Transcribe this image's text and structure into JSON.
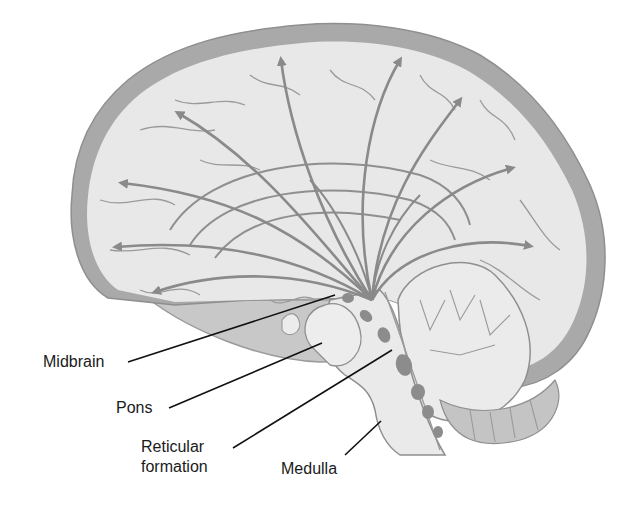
{
  "diagram": {
    "colors": {
      "cortex_fill": "#e8e8e8",
      "cortex_rim": "#a9a9a9",
      "outline": "#8f8f8f",
      "arrow": "#8a8a8a",
      "nucleus": "#8c8c8c",
      "brainstem_fill": "#eaeaea",
      "shadow_fill": "#c8c8c8",
      "leader_line": "#111111"
    },
    "labels": [
      {
        "id": "midbrain",
        "text": "Midbrain"
      },
      {
        "id": "pons",
        "text": "Pons"
      },
      {
        "id": "reticular-formation",
        "text": "Reticular\nformation"
      },
      {
        "id": "medulla",
        "text": "Medulla"
      }
    ],
    "arrows_count": 9
  }
}
